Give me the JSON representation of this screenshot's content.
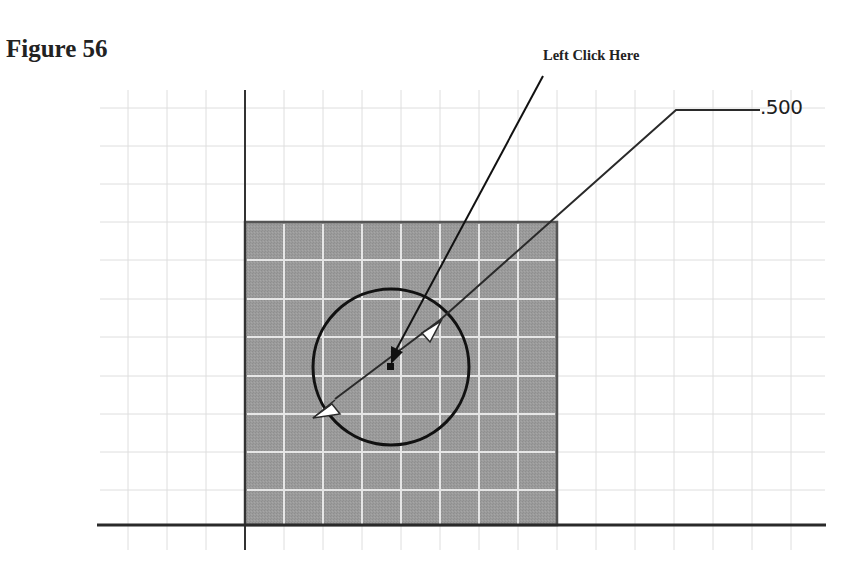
{
  "figure": {
    "title": "Figure 56"
  },
  "callout": {
    "label": "Left Click Here",
    "target": "center-point-of-circle"
  },
  "dimension": {
    "type": "diameter",
    "value": ".500"
  },
  "sketch": {
    "grid_color": "#dcdcdc",
    "profile_fill": "#9a9a9a",
    "profile_grid_color": "#e8e8e8",
    "line_color": "#1e1e1e",
    "shapes": [
      {
        "name": "square-profile",
        "kind": "rectangle"
      },
      {
        "name": "circle",
        "kind": "circle",
        "diameter_label": ".500"
      }
    ]
  }
}
